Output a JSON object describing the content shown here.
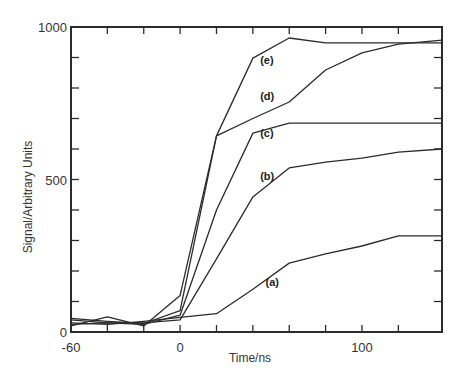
{
  "chart_data": {
    "type": "line",
    "title": "",
    "xlabel": "Time/ns",
    "ylabel": "Signal/Arbitrary Units",
    "xlim": [
      -60,
      144
    ],
    "ylim": [
      0,
      1000
    ],
    "x_tick_labels": [
      "-60",
      "0",
      "100"
    ],
    "x_major_ticks": [
      -60,
      0,
      100
    ],
    "x_minor_ticks": [
      -40,
      -20,
      20,
      40,
      60,
      80,
      120
    ],
    "y_tick_labels": [
      "0",
      "500",
      "1000"
    ],
    "y_major_ticks": [
      0,
      500,
      1000
    ],
    "y_minor_ticks": [
      100,
      200,
      300,
      400,
      600,
      700,
      800,
      900
    ],
    "grid": false,
    "legend": "inline labels next to curves",
    "x": [
      -60,
      -40,
      -20,
      0,
      20,
      40,
      60,
      80,
      100,
      120,
      144
    ],
    "series": [
      {
        "name": "(a)",
        "values": [
          30,
          25,
          35,
          48,
          60,
          140,
          226,
          256,
          282,
          315,
          315
        ]
      },
      {
        "name": "(b)",
        "values": [
          40,
          30,
          30,
          40,
          240,
          443,
          538,
          557,
          570,
          590,
          600
        ]
      },
      {
        "name": "(c)",
        "values": [
          25,
          30,
          25,
          55,
          400,
          652,
          685,
          685,
          685,
          685,
          685
        ]
      },
      {
        "name": "(d)",
        "values": [
          45,
          35,
          28,
          70,
          643,
          700,
          754,
          859,
          915,
          944,
          957
        ]
      },
      {
        "name": "(e)",
        "values": [
          20,
          50,
          20,
          120,
          643,
          898,
          964,
          948,
          948,
          948,
          948
        ]
      }
    ],
    "annotations": [
      {
        "text": "(e)",
        "x": 44,
        "y": 880
      },
      {
        "text": "(d)",
        "x": 44,
        "y": 760
      },
      {
        "text": "(c)",
        "x": 44,
        "y": 640
      },
      {
        "text": "(b)",
        "x": 44,
        "y": 500
      },
      {
        "text": "(a)",
        "x": 47,
        "y": 150
      }
    ]
  }
}
